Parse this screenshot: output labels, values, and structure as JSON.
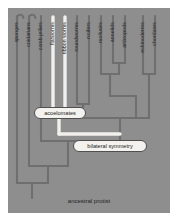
{
  "figure": {
    "kind": "cladogram",
    "panel_bg": "#8e8e8e",
    "branch_color": "#6f6f6f",
    "highlight_color": "#f2f0ec",
    "root_label": "ancestral protist"
  },
  "tips": [
    {
      "id": "sponges",
      "label": "sponges",
      "x": 17,
      "highlighted": false
    },
    {
      "id": "cnidarians",
      "label": "cnidarians",
      "x": 29,
      "highlighted": false
    },
    {
      "id": "comb-jellies",
      "label": "comb jellies",
      "x": 41,
      "highlighted": false
    },
    {
      "id": "flatworms",
      "label": "flatworms",
      "x": 53,
      "highlighted": true
    },
    {
      "id": "ribbon-worms",
      "label": "ribbon worms",
      "x": 65,
      "highlighted": true
    },
    {
      "id": "roundworms",
      "label": "roundworms",
      "x": 77,
      "highlighted": false
    },
    {
      "id": "rotifers",
      "label": "rotifers",
      "x": 89,
      "highlighted": false
    },
    {
      "id": "mollusks",
      "label": "mollusks",
      "x": 101,
      "highlighted": false
    },
    {
      "id": "annelids",
      "label": "annelids",
      "x": 113,
      "highlighted": false
    },
    {
      "id": "arthropods",
      "label": "arthropods",
      "x": 125,
      "highlighted": false
    },
    {
      "id": "echinoderms",
      "label": "echinoderms",
      "x": 143,
      "highlighted": false
    },
    {
      "id": "chordates",
      "label": "chordates",
      "x": 155,
      "highlighted": false
    }
  ],
  "nodes": [
    {
      "id": "acoelomates",
      "label": "acoelomates",
      "highlighted": true
    },
    {
      "id": "bilateral-symmetry",
      "label": "bilateral symmetry",
      "highlighted": false
    }
  ]
}
